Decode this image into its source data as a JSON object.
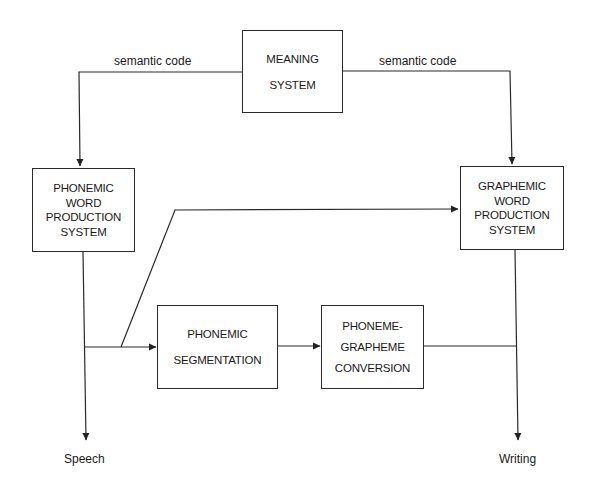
{
  "diagram": {
    "type": "flow-diagram",
    "nodes": {
      "meaning_system": {
        "lines": [
          "MEANING",
          "SYSTEM"
        ]
      },
      "phonemic_word_production": {
        "lines": [
          "PHONEMIC",
          "WORD",
          "PRODUCTION",
          "SYSTEM"
        ]
      },
      "graphemic_word_production": {
        "lines": [
          "GRAPHEMIC",
          "WORD",
          "PRODUCTION",
          "SYSTEM"
        ]
      },
      "phonemic_segmentation": {
        "lines": [
          "PHONEMIC",
          "SEGMENTATION"
        ]
      },
      "phoneme_grapheme_conversion": {
        "lines": [
          "PHONEME-",
          "GRAPHEME",
          "CONVERSION"
        ]
      }
    },
    "edge_labels": {
      "left_semantic": "semantic code",
      "right_semantic": "semantic code"
    },
    "outputs": {
      "speech": "Speech",
      "writing": "Writing"
    },
    "edges": [
      {
        "from": "meaning_system",
        "to": "phonemic_word_production",
        "label": "semantic code"
      },
      {
        "from": "meaning_system",
        "to": "graphemic_word_production",
        "label": "semantic code"
      },
      {
        "from": "phonemic_word_production",
        "to": "speech"
      },
      {
        "from": "phonemic_word_production",
        "to": "graphemic_word_production"
      },
      {
        "from": "phonemic_word_production",
        "to": "phonemic_segmentation"
      },
      {
        "from": "phonemic_segmentation",
        "to": "phoneme_grapheme_conversion"
      },
      {
        "from": "phoneme_grapheme_conversion",
        "to": "writing"
      },
      {
        "from": "graphemic_word_production",
        "to": "writing"
      }
    ],
    "colors": {
      "ink": "#2a2a2a",
      "background": "#ffffff"
    }
  }
}
